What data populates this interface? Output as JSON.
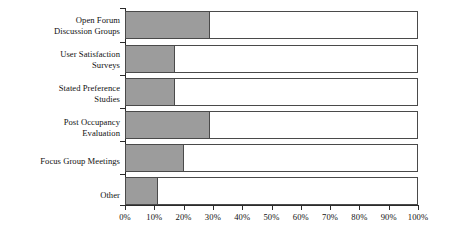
{
  "chart_data": {
    "type": "bar",
    "orientation": "horizontal",
    "title": "",
    "subtitle": "",
    "xlabel": "",
    "ylabel": "",
    "categories": [
      "Open Forum Discussion Groups",
      "User Satisfaction Surveys",
      "Stated Preference Studies",
      "Post Occupancy Evaluation",
      "Focus Group Meetings",
      "Other"
    ],
    "category_lines": [
      [
        "Open Forum",
        "Discussion Groups"
      ],
      [
        "User Satisfaction",
        "Surveys"
      ],
      [
        "Stated Preference",
        "Studies"
      ],
      [
        "Post Occupancy",
        "Evaluation"
      ],
      [
        "Focus Group Meetings"
      ],
      [
        "Other"
      ]
    ],
    "values": [
      29,
      17,
      17,
      29,
      20,
      11
    ],
    "value_unit": "%",
    "xlim": [
      0,
      100
    ],
    "xticks": [
      0,
      10,
      20,
      30,
      40,
      50,
      60,
      70,
      80,
      90,
      100
    ],
    "xtick_labels": [
      "0%",
      "10%",
      "20%",
      "30%",
      "40%",
      "50%",
      "60%",
      "70%",
      "80%",
      "90%",
      "100%"
    ],
    "grid": false,
    "legend": "none",
    "series": [
      {
        "name": "Percentage",
        "values": [
          29,
          17,
          17,
          29,
          20,
          11
        ]
      }
    ],
    "colors": {
      "fill": "#9c9c9c",
      "track": "#ffffff",
      "border": "#4a4a4a",
      "axis": "#2b2b2b",
      "text": "#111111",
      "background": "#ffffff"
    }
  }
}
